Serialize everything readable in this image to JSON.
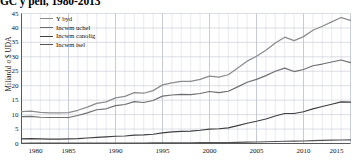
{
  "title": "GC y pen, 1980-2013",
  "axis": {
    "ylabel": "Miliardd o $ UDA",
    "yticks": [
      "0",
      "5",
      "10",
      "15",
      "20",
      "25",
      "30",
      "35",
      "40",
      "45"
    ],
    "xticks": [
      "1980",
      "1985",
      "1990",
      "1995",
      "2000",
      "2005",
      "2010",
      "2015"
    ]
  },
  "legend": {
    "items": [
      {
        "label": "Y byd",
        "color": "#8c8c8c"
      },
      {
        "label": "Incwm uchel",
        "color": "#6e6e6e"
      },
      {
        "label": "Incwm canolig",
        "color": "#3f3f3f"
      },
      {
        "label": "Incwm isel",
        "color": "#545454"
      }
    ]
  },
  "chart_data": {
    "type": "line",
    "title": "GC y pen, 1980-2013",
    "xlabel": "",
    "ylabel": "Miliardd o $ UDA",
    "xlim": [
      1980,
      2015
    ],
    "ylim": [
      0,
      45
    ],
    "grid": true,
    "legend_position": "top-left",
    "x": [
      1980,
      1981,
      1982,
      1983,
      1984,
      1985,
      1986,
      1987,
      1988,
      1989,
      1990,
      1991,
      1992,
      1993,
      1994,
      1995,
      1996,
      1997,
      1998,
      1999,
      2000,
      2001,
      2002,
      2003,
      2004,
      2005,
      2006,
      2007,
      2008,
      2009,
      2010,
      2011,
      2012,
      2013,
      2014,
      2015
    ],
    "series": [
      {
        "name": "Y byd",
        "color": "#8c8c8c",
        "values": [
          11.0,
          11.2,
          10.8,
          10.6,
          10.6,
          10.7,
          11.5,
          12.6,
          13.9,
          14.4,
          15.8,
          16.3,
          17.6,
          17.4,
          18.3,
          20.3,
          21.0,
          21.5,
          21.5,
          22.2,
          23.3,
          23.0,
          23.8,
          26.1,
          28.5,
          30.2,
          32.3,
          34.8,
          36.8,
          35.6,
          37.0,
          39.2,
          40.6,
          42.1,
          43.6,
          42.6
        ]
      },
      {
        "name": "Incwm uchel",
        "color": "#6e6e6e",
        "values": [
          9.3,
          9.4,
          9.1,
          9.0,
          9.0,
          9.0,
          9.7,
          10.6,
          11.7,
          12.0,
          13.1,
          13.5,
          14.5,
          14.2,
          14.9,
          16.4,
          16.8,
          17.0,
          16.9,
          17.3,
          18.0,
          17.6,
          18.1,
          19.6,
          21.2,
          22.2,
          23.5,
          25.0,
          26.1,
          24.9,
          25.6,
          26.9,
          27.5,
          28.2,
          28.9,
          28.0
        ]
      },
      {
        "name": "Incwm canolig",
        "color": "#3f3f3f",
        "values": [
          1.6,
          1.7,
          1.6,
          1.5,
          1.5,
          1.6,
          1.7,
          1.9,
          2.1,
          2.3,
          2.5,
          2.6,
          2.9,
          3.0,
          3.2,
          3.7,
          4.0,
          4.2,
          4.3,
          4.6,
          5.0,
          5.1,
          5.4,
          6.2,
          7.0,
          7.7,
          8.5,
          9.5,
          10.4,
          10.4,
          11.0,
          12.0,
          12.8,
          13.6,
          14.4,
          14.3
        ]
      },
      {
        "name": "Incwm isel",
        "color": "#545454",
        "values": [
          0.1,
          0.11,
          0.11,
          0.11,
          0.11,
          0.11,
          0.12,
          0.13,
          0.14,
          0.15,
          0.16,
          0.17,
          0.18,
          0.19,
          0.2,
          0.22,
          0.24,
          0.26,
          0.27,
          0.29,
          0.31,
          0.33,
          0.35,
          0.4,
          0.46,
          0.52,
          0.59,
          0.68,
          0.78,
          0.8,
          0.88,
          0.98,
          1.06,
          1.15,
          1.23,
          1.25
        ]
      }
    ]
  }
}
